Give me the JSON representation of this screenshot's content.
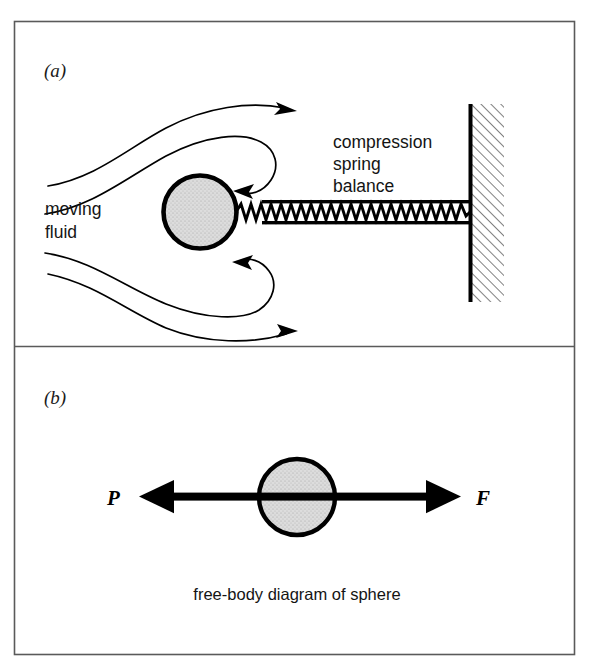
{
  "figure": {
    "frame": {
      "border_color": "#5a5a5a",
      "divider_color": "#5a5a5a",
      "background": "#ffffff"
    },
    "ink_color": "#000000",
    "sphere_fill": "#d9d9d9"
  },
  "panel_a": {
    "letter": "(a)",
    "labels": {
      "fluid": {
        "line1": "moving",
        "line2": "fluid"
      },
      "spring_balance": {
        "line1": "compression",
        "line2": "spring",
        "line3": "balance"
      }
    },
    "elements": {
      "sphere_name": "sphere",
      "spring_name": "compression-spring-balance",
      "wall_name": "fixed-wall",
      "streamlines_name": "fluid-streamlines"
    }
  },
  "panel_b": {
    "letter": "(b)",
    "caption": "free-body diagram of sphere",
    "forces": [
      {
        "symbol": "P",
        "direction": "left",
        "name": "pressure-drag-force"
      },
      {
        "symbol": "F",
        "direction": "right",
        "name": "spring-reaction-force"
      }
    ]
  }
}
